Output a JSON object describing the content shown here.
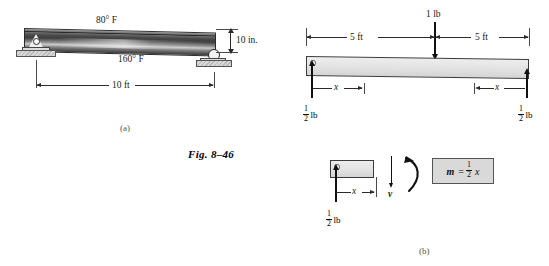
{
  "figure": {
    "caption": "Fig. 8–46",
    "panel_a_tag": "(a)",
    "panel_b_tag": "(b)"
  },
  "panel_a": {
    "top_temperature": "80° F",
    "bottom_temperature": "160° F",
    "depth_dimension": "10 in.",
    "span_dimension": "10 ft",
    "left_support": "pin-support",
    "right_support": "roller-support"
  },
  "panel_b": {
    "applied_load": "1 lb",
    "left_span": "5 ft",
    "right_span": "5 ft",
    "left_reaction": {
      "numerator": "1",
      "denominator": "2",
      "unit": "lb"
    },
    "right_reaction": {
      "numerator": "1",
      "denominator": "2",
      "unit": "lb"
    },
    "distance_left": "x",
    "distance_right": "x",
    "section": {
      "reaction": {
        "numerator": "1",
        "denominator": "2",
        "unit": "lb"
      },
      "distance": "x",
      "shear_label": "v",
      "moment_equation": {
        "symbol": "m",
        "equals": "=",
        "numerator": "1",
        "denominator": "2",
        "variable": "x"
      }
    }
  },
  "colors": {
    "ink": "#1a1a1a",
    "beam_fill": "#e2e2e2",
    "eq_box_fill": "#d9d9d9",
    "support_fill": "#c8c8c8"
  }
}
